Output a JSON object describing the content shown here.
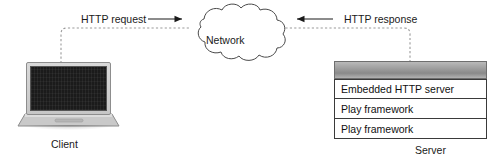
{
  "diagram": {
    "flows": [
      {
        "id": "request",
        "label": "HTTP request",
        "direction": "right",
        "arrow_glyph": "→"
      },
      {
        "id": "response",
        "label": "HTTP response",
        "direction": "left",
        "arrow_glyph": "←"
      }
    ],
    "nodes": {
      "client": {
        "label": "Client",
        "device": "laptop"
      },
      "network": {
        "label": "Network",
        "shape": "cloud"
      },
      "server": {
        "label": "Server",
        "device": "rack-server",
        "stack": [
          {
            "label": "Embedded HTTP server"
          },
          {
            "label": "Play framework"
          },
          {
            "label": "Play framework"
          }
        ]
      }
    },
    "colors": {
      "background": "#ffffff",
      "line": "#8c8c8c",
      "text": "#1a1a1a",
      "box_border": "#3a3a3a",
      "box_fill": "#ffffff",
      "screen": "#1b1b1b",
      "chassis": "#9e9e9e"
    }
  }
}
